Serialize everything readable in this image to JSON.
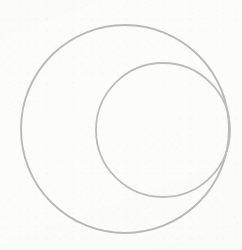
{
  "figure": {
    "medium": "pencil line drawing on paper",
    "canvas": {
      "width": 242,
      "height": 250,
      "background_color": "#fcfcfb"
    },
    "stroke": {
      "color": "#b9b9b7",
      "secondary_color": "#cfcfcd",
      "width": 1.8,
      "style": "dithered-soft-pencil"
    },
    "shapes": [
      {
        "id": "outer-circle",
        "name": "outer-circle",
        "type": "circle",
        "cx": 125,
        "cy": 129,
        "r": 104,
        "stroke_color": "#b9b9b7",
        "stroke_width": 1.9,
        "label": "Outer circle"
      },
      {
        "id": "inner-circle",
        "name": "inner-circle",
        "type": "circle",
        "cx": 163,
        "cy": 130,
        "r": 67,
        "stroke_color": "#bcbcba",
        "stroke_width": 1.8,
        "label": "Inner circle"
      }
    ],
    "extents": {
      "outer_left_x": 21,
      "outer_right_x": 229,
      "outer_top_y": 25,
      "outer_bottom_y": 233,
      "inner_left_x": 96,
      "inner_right_x": 230,
      "inner_top_y": 63,
      "inner_bottom_y": 197
    }
  }
}
